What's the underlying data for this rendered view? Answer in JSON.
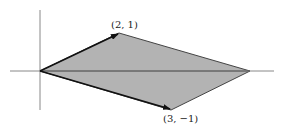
{
  "diagram": {
    "type": "parallelogram-vectors",
    "fill_color": "#b3b3b3",
    "edge_color": "#444444",
    "axis_color": "#888888",
    "arrow_color": "#111111",
    "vectors": [
      {
        "label": "(2, 1)",
        "x": 2,
        "y": 1
      },
      {
        "label": "(3, −1)",
        "x": 3,
        "y": -1
      }
    ],
    "vertices": [
      {
        "x": 0,
        "y": 0
      },
      {
        "x": 2,
        "y": 1
      },
      {
        "x": 5,
        "y": 0
      },
      {
        "x": 3,
        "y": -1
      }
    ]
  }
}
